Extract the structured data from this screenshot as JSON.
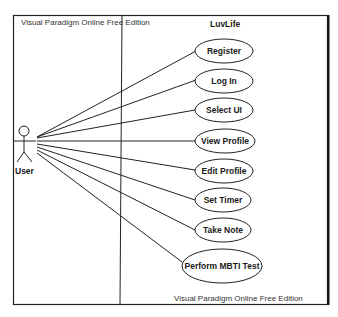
{
  "watermark_top": "Visual Paradigm Online Free Edition",
  "watermark_bottom": "Visual Paradigm Online Free Edition",
  "system": {
    "title": "LuvLife"
  },
  "actor": {
    "name": "User",
    "icon": "stick-figure-icon"
  },
  "use_cases": [
    {
      "label": "Register"
    },
    {
      "label": "Log In"
    },
    {
      "label": "Select UI"
    },
    {
      "label": "View Profile"
    },
    {
      "label": "Edit Profile"
    },
    {
      "label": "Set Timer"
    },
    {
      "label": "Take Note"
    },
    {
      "label": "Perform MBTI Test"
    }
  ],
  "colors": {
    "line": "#1a1a1a",
    "background": "#ffffff",
    "text": "#1a1a1a"
  }
}
